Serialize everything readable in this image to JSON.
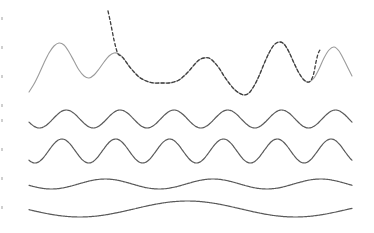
{
  "figure": {
    "background_color": "#ffffff",
    "width": 374,
    "height": 233
  },
  "colors": {
    "signal_solid": "#9b9b9b",
    "signal_dashed": "#3f3f3f",
    "component_stroke": "#5a5a5a",
    "edge_artifact": "#cfcfcf",
    "background": "#ffffff"
  },
  "chart_data": {
    "type": "line",
    "title": "",
    "subtitle": "",
    "xlabel": "",
    "ylabel": "",
    "xlim": [
      0,
      374
    ],
    "ylim": [
      0,
      233
    ],
    "grid": false,
    "legend": "none",
    "axes_visible": false,
    "tick_labels_x": [],
    "tick_labels_y": [],
    "annotations": [],
    "series": [
      {
        "name": "composite-signal-solid",
        "style": "solid",
        "color": "#9b9b9b",
        "stroke_width": 1.1,
        "row": 1,
        "baseline_y": 66,
        "x_start": 29,
        "x_end": 352,
        "points": [
          [
            29,
            92
          ],
          [
            34,
            84
          ],
          [
            39,
            74
          ],
          [
            44,
            63
          ],
          [
            49,
            53
          ],
          [
            54,
            46
          ],
          [
            59,
            43
          ],
          [
            64,
            45
          ],
          [
            69,
            52
          ],
          [
            74,
            61
          ],
          [
            79,
            70
          ],
          [
            84,
            76
          ],
          [
            89,
            78
          ],
          [
            94,
            75
          ],
          [
            99,
            69
          ],
          [
            104,
            62
          ],
          [
            109,
            56
          ],
          [
            114,
            53
          ],
          [
            119,
            54
          ],
          [
            124,
            59
          ],
          [
            129,
            66
          ],
          [
            134,
            72
          ],
          [
            139,
            77
          ],
          [
            144,
            80
          ],
          [
            149,
            82
          ],
          [
            154,
            83
          ],
          [
            159,
            83
          ],
          [
            164,
            83
          ],
          [
            169,
            83
          ],
          [
            174,
            82
          ],
          [
            179,
            80
          ],
          [
            184,
            76
          ],
          [
            189,
            71
          ],
          [
            194,
            65
          ],
          [
            199,
            60
          ],
          [
            204,
            58
          ],
          [
            209,
            58
          ],
          [
            214,
            62
          ],
          [
            219,
            68
          ],
          [
            224,
            76
          ],
          [
            229,
            83
          ],
          [
            234,
            89
          ],
          [
            239,
            93
          ],
          [
            244,
            95
          ],
          [
            249,
            93
          ],
          [
            254,
            86
          ],
          [
            259,
            76
          ],
          [
            264,
            64
          ],
          [
            269,
            53
          ],
          [
            274,
            45
          ],
          [
            279,
            42
          ],
          [
            284,
            44
          ],
          [
            289,
            52
          ],
          [
            294,
            63
          ],
          [
            299,
            73
          ],
          [
            304,
            80
          ],
          [
            309,
            82
          ],
          [
            314,
            78
          ],
          [
            319,
            69
          ],
          [
            324,
            58
          ],
          [
            329,
            50
          ],
          [
            334,
            47
          ],
          [
            339,
            51
          ],
          [
            344,
            60
          ],
          [
            349,
            70
          ],
          [
            352,
            76
          ]
        ]
      },
      {
        "name": "composite-signal-dashed",
        "style": "dashed",
        "dash_pattern": "3,2.5",
        "color": "#3f3f3f",
        "stroke_width": 1.3,
        "row": 1,
        "x_start": 108,
        "x_end": 322,
        "note": "Dashed trace rises steeply off the top of the frame near x=108 and plunges steeply downward near x=315; between those it coincides with the solid gray trace.",
        "points": [
          [
            108,
            11
          ],
          [
            110,
            20
          ],
          [
            112,
            30
          ],
          [
            114,
            40
          ],
          [
            116,
            48
          ],
          [
            118,
            54
          ],
          [
            121,
            56
          ],
          [
            124,
            59
          ],
          [
            129,
            66
          ],
          [
            134,
            72
          ],
          [
            139,
            77
          ],
          [
            144,
            80
          ],
          [
            149,
            82
          ],
          [
            154,
            83
          ],
          [
            159,
            83
          ],
          [
            164,
            83
          ],
          [
            169,
            83
          ],
          [
            174,
            82
          ],
          [
            179,
            80
          ],
          [
            184,
            76
          ],
          [
            189,
            71
          ],
          [
            194,
            65
          ],
          [
            199,
            60
          ],
          [
            204,
            58
          ],
          [
            209,
            58
          ],
          [
            214,
            62
          ],
          [
            219,
            68
          ],
          [
            224,
            76
          ],
          [
            229,
            83
          ],
          [
            234,
            89
          ],
          [
            239,
            93
          ],
          [
            244,
            95
          ],
          [
            249,
            93
          ],
          [
            254,
            86
          ],
          [
            259,
            76
          ],
          [
            264,
            64
          ],
          [
            269,
            53
          ],
          [
            274,
            45
          ],
          [
            279,
            42
          ],
          [
            284,
            44
          ],
          [
            289,
            52
          ],
          [
            294,
            63
          ],
          [
            299,
            73
          ],
          [
            304,
            80
          ],
          [
            309,
            82
          ],
          [
            313,
            76
          ],
          [
            316,
            62
          ],
          [
            318,
            54
          ],
          [
            320,
            50
          ],
          [
            322,
            49
          ]
        ]
      },
      {
        "name": "component-1",
        "style": "solid",
        "color": "#5a5a5a",
        "stroke_width": 1.2,
        "row": 2,
        "baseline_y": 119,
        "amplitude": 9,
        "periods": 6.0,
        "phase_deg": 200,
        "x_start": 29,
        "x_end": 352
      },
      {
        "name": "component-2",
        "style": "solid",
        "color": "#5a5a5a",
        "stroke_width": 1.2,
        "row": 3,
        "baseline_y": 151,
        "amplitude": 12,
        "periods": 6.0,
        "phase_deg": 230,
        "x_start": 29,
        "x_end": 352
      },
      {
        "name": "component-3",
        "style": "solid",
        "color": "#5a5a5a",
        "stroke_width": 1.2,
        "row": 4,
        "baseline_y": 184,
        "amplitude": 5,
        "periods": 3.0,
        "phase_deg": 195,
        "x_start": 29,
        "x_end": 352
      },
      {
        "name": "component-4",
        "style": "solid",
        "color": "#5a5a5a",
        "stroke_width": 1.2,
        "row": 5,
        "baseline_y": 209,
        "amplitude": 8,
        "periods": 1.5,
        "phase_deg": 185,
        "x_start": 29,
        "x_end": 352
      }
    ]
  },
  "edge_artifacts": [
    {
      "x": 1,
      "y": 17,
      "w": 2,
      "h": 3
    },
    {
      "x": 1,
      "y": 46,
      "w": 2,
      "h": 3
    },
    {
      "x": 1,
      "y": 75,
      "w": 2,
      "h": 3
    },
    {
      "x": 1,
      "y": 104,
      "w": 2,
      "h": 3
    },
    {
      "x": 1,
      "y": 119,
      "w": 2,
      "h": 3
    },
    {
      "x": 1,
      "y": 148,
      "w": 2,
      "h": 3
    },
    {
      "x": 1,
      "y": 177,
      "w": 2,
      "h": 3
    },
    {
      "x": 1,
      "y": 206,
      "w": 2,
      "h": 3
    }
  ]
}
